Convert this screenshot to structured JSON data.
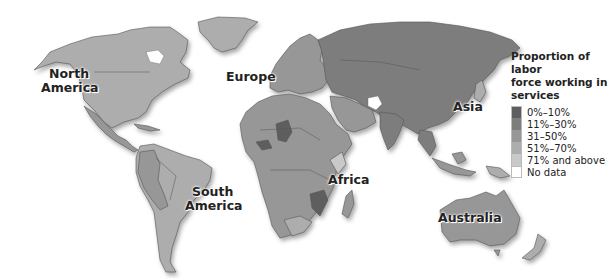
{
  "map": {
    "type": "choropleth",
    "subject": "Proportion of labor force working in services",
    "region_labels": [
      {
        "id": "north-america",
        "text_line1": "North",
        "text_line2": "America"
      },
      {
        "id": "europe",
        "text_line1": "Europe",
        "text_line2": ""
      },
      {
        "id": "asia",
        "text_line1": "Asia",
        "text_line2": ""
      },
      {
        "id": "africa",
        "text_line1": "Africa",
        "text_line2": ""
      },
      {
        "id": "south-america",
        "text_line1": "South",
        "text_line2": "America"
      },
      {
        "id": "australia",
        "text_line1": "Australia",
        "text_line2": ""
      }
    ],
    "legend": {
      "title_line1": "Proportion of labor",
      "title_line2": "force working in",
      "title_line3": "services",
      "items": [
        {
          "label": "0%–10%",
          "color": "#5e5e5e"
        },
        {
          "label": "11%–30%",
          "color": "#7d7d7d"
        },
        {
          "label": "31–50%",
          "color": "#979797"
        },
        {
          "label": "51%–70%",
          "color": "#adadad"
        },
        {
          "label": "71% and above",
          "color": "#c9c9c9"
        },
        {
          "label": "No data",
          "color": "#ffffff"
        }
      ]
    }
  }
}
